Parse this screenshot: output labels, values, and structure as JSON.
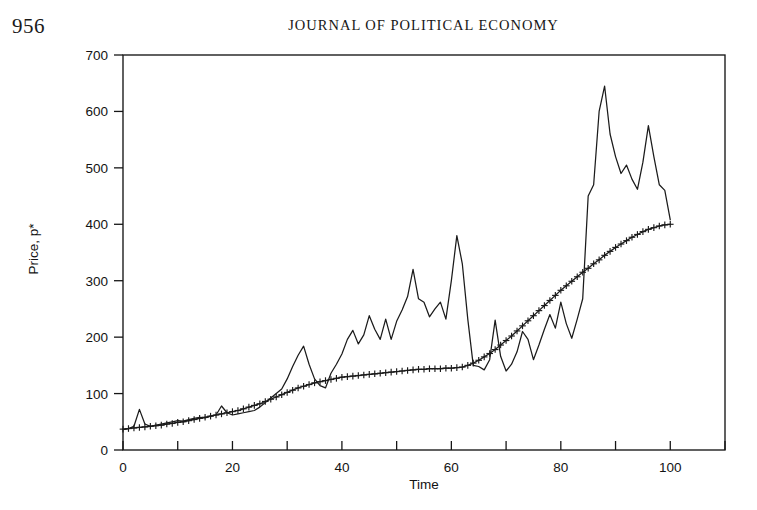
{
  "page": {
    "folio": "956",
    "running_head": "JOURNAL OF POLITICAL ECONOMY"
  },
  "chart_data": {
    "type": "line",
    "title": "",
    "xlabel": "Time",
    "ylabel": "Price, p*",
    "xlim": [
      0,
      110
    ],
    "ylim": [
      0,
      700
    ],
    "grid": false,
    "legend": "none",
    "x_ticks": [
      0,
      10,
      20,
      30,
      40,
      50,
      60,
      70,
      80,
      90,
      100,
      110
    ],
    "x_tick_labels": [
      "0",
      "",
      "20",
      "",
      "40",
      "",
      "60",
      "",
      "80",
      "",
      "100",
      ""
    ],
    "y_ticks": [
      0,
      100,
      200,
      300,
      400,
      500,
      600,
      700
    ],
    "y_tick_labels": [
      "0",
      "100",
      "200",
      "300",
      "400",
      "500",
      "600",
      "700"
    ],
    "series": [
      {
        "name": "price",
        "marker": "none",
        "x": [
          0,
          1,
          2,
          3,
          4,
          5,
          6,
          7,
          8,
          9,
          10,
          11,
          12,
          13,
          14,
          15,
          16,
          17,
          18,
          19,
          20,
          21,
          22,
          23,
          24,
          25,
          26,
          27,
          28,
          29,
          30,
          31,
          32,
          33,
          34,
          35,
          36,
          37,
          38,
          39,
          40,
          41,
          42,
          43,
          44,
          45,
          46,
          47,
          48,
          49,
          50,
          51,
          52,
          53,
          54,
          55,
          56,
          57,
          58,
          59,
          60,
          61,
          62,
          63,
          64,
          65,
          66,
          67,
          68,
          69,
          70,
          71,
          72,
          73,
          74,
          75,
          76,
          77,
          78,
          79,
          80,
          81,
          82,
          83,
          84,
          85,
          86,
          87,
          88,
          89,
          90,
          91,
          92,
          93,
          94,
          95,
          96,
          97,
          98,
          99,
          100
        ],
        "values": [
          36,
          38,
          42,
          72,
          46,
          42,
          44,
          46,
          48,
          50,
          52,
          51,
          54,
          56,
          58,
          57,
          60,
          62,
          78,
          66,
          62,
          64,
          66,
          68,
          70,
          76,
          84,
          92,
          100,
          108,
          126,
          148,
          168,
          184,
          152,
          126,
          114,
          110,
          136,
          152,
          170,
          196,
          212,
          188,
          204,
          238,
          214,
          196,
          232,
          196,
          228,
          248,
          272,
          320,
          268,
          262,
          236,
          250,
          262,
          232,
          300,
          380,
          330,
          232,
          150,
          148,
          142,
          160,
          230,
          166,
          140,
          152,
          174,
          210,
          196,
          160,
          186,
          214,
          240,
          216,
          262,
          224,
          198,
          232,
          268,
          450,
          470,
          600,
          645,
          560,
          520,
          490,
          505,
          480,
          462,
          510,
          575,
          520,
          470,
          460,
          408
        ]
      },
      {
        "name": "fundamental",
        "marker": "plus",
        "x": [
          0,
          1,
          2,
          3,
          4,
          5,
          6,
          7,
          8,
          9,
          10,
          11,
          12,
          13,
          14,
          15,
          16,
          17,
          18,
          19,
          20,
          21,
          22,
          23,
          24,
          25,
          26,
          27,
          28,
          29,
          30,
          31,
          32,
          33,
          34,
          35,
          36,
          37,
          38,
          39,
          40,
          41,
          42,
          43,
          44,
          45,
          46,
          47,
          48,
          49,
          50,
          51,
          52,
          53,
          54,
          55,
          56,
          57,
          58,
          59,
          60,
          61,
          62,
          63,
          64,
          65,
          66,
          67,
          68,
          69,
          70,
          71,
          72,
          73,
          74,
          75,
          76,
          77,
          78,
          79,
          80,
          81,
          82,
          83,
          84,
          85,
          86,
          87,
          88,
          89,
          90,
          91,
          92,
          93,
          94,
          95,
          96,
          97,
          98,
          99,
          100
        ],
        "values": [
          37,
          38,
          39,
          40,
          41,
          42,
          43,
          44,
          46,
          47,
          49,
          50,
          52,
          54,
          56,
          58,
          60,
          62,
          64,
          66,
          68,
          70,
          73,
          76,
          79,
          82,
          86,
          90,
          94,
          98,
          102,
          106,
          110,
          113,
          116,
          119,
          121,
          123,
          125,
          127,
          129,
          130,
          131,
          132,
          133,
          134,
          135,
          136,
          137,
          138,
          139,
          140,
          141,
          142,
          143,
          143,
          144,
          144,
          144,
          145,
          145,
          146,
          147,
          150,
          154,
          159,
          165,
          171,
          178,
          186,
          194,
          202,
          211,
          220,
          229,
          238,
          247,
          256,
          265,
          274,
          283,
          291,
          299,
          307,
          315,
          322,
          330,
          337,
          345,
          352,
          359,
          365,
          371,
          377,
          382,
          387,
          391,
          394,
          397,
          399,
          400
        ]
      }
    ],
    "annotations": []
  }
}
